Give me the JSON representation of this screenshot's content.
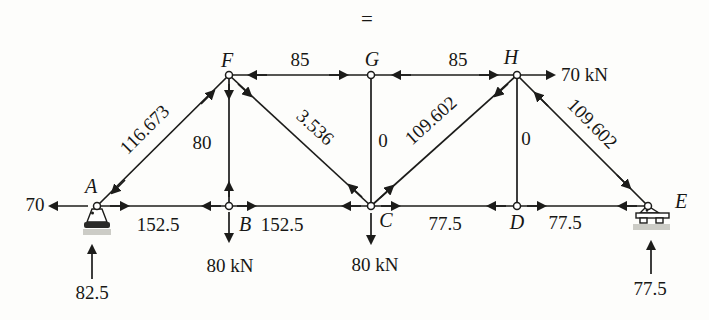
{
  "figure": {
    "equals_sign": "=",
    "joint_labels": {
      "A": "A",
      "B": "B",
      "C": "C",
      "D": "D",
      "E": "E",
      "F": "F",
      "G": "G",
      "H": "H"
    },
    "member_forces": {
      "AB": "152.5",
      "BC": "152.5",
      "CD": "77.5",
      "DE": "77.5",
      "FG": "85",
      "GH": "85",
      "AF": "116.673",
      "FB": "80",
      "FC": "3.536",
      "GC": "0",
      "CH": "109.602",
      "HD": "0",
      "HE": "109.602"
    },
    "applied_loads": {
      "A_left": "70",
      "H_right": "70 kN",
      "B_down": "80 kN",
      "C_down": "80 kN"
    },
    "reactions": {
      "A_up": "82.5",
      "E_up": "77.5"
    }
  }
}
